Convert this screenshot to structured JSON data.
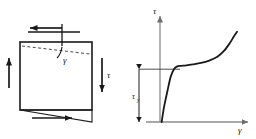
{
  "figure": {
    "background_color": "#ffffff",
    "line_color": "#1a1a1a",
    "dashed_color": "#555555",
    "axis_color": "#8c8c8c"
  },
  "left_panel": {
    "name": "shear-deformed-element",
    "element_shape": "square",
    "labels": {
      "shear_angle": "γ",
      "shear_stress_right": "τ"
    },
    "arrows": {
      "top_label": "",
      "top_direction": "left",
      "left_direction": "up",
      "right_direction": "down",
      "bottom_direction": "right"
    },
    "deformed_outline": "dashed",
    "element": {
      "x": 20,
      "y": 42,
      "width": 72,
      "height": 68
    }
  },
  "right_panel": {
    "name": "shear-stress-strain-diagram",
    "axis_labels": {
      "y": "τ",
      "x": "γ"
    },
    "annotation": {
      "yield_label": "τ",
      "yield_sub": "y"
    }
  },
  "chart_data": {
    "type": "line",
    "title": "",
    "xlabel": "γ",
    "ylabel": "τ",
    "xlim": [
      0,
      1
    ],
    "ylim": [
      0,
      1
    ],
    "grid": false,
    "legend": null,
    "annotations": [
      {
        "text": "τy",
        "description": "yield shear stress marked by dimension arrow on y-axis",
        "y": 0.55
      }
    ],
    "series": [
      {
        "name": "shear stress-strain curve",
        "x": [
          0.02,
          0.05,
          0.09,
          0.13,
          0.17,
          0.21,
          0.26,
          0.32,
          0.4,
          0.5,
          0.6,
          0.7,
          0.78,
          0.85,
          0.9,
          0.94
        ],
        "y": [
          0.0,
          0.16,
          0.32,
          0.47,
          0.55,
          0.58,
          0.585,
          0.59,
          0.6,
          0.615,
          0.64,
          0.68,
          0.74,
          0.82,
          0.89,
          0.94
        ]
      }
    ]
  }
}
